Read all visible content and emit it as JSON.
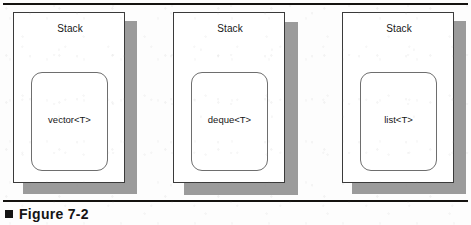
{
  "figure": {
    "caption_bullet": "filled-square",
    "caption": "Figure 7-2",
    "rule_color": "#14120f",
    "shadow_color": "#9b9b9b",
    "card_border_color": "#3a3a3a",
    "inner_border_color": "#6e6e6e",
    "background_color": "#fdfdfd"
  },
  "cards": [
    {
      "title": "Stack",
      "container": "vector<T>"
    },
    {
      "title": "Stack",
      "container": "deque<T>"
    },
    {
      "title": "Stack",
      "container": "list<T>"
    }
  ]
}
